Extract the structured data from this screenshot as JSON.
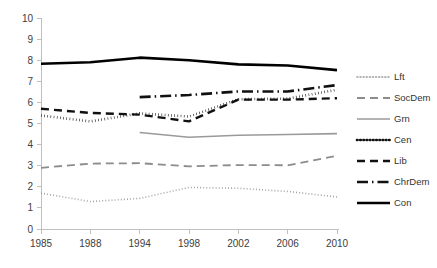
{
  "chart_data": {
    "type": "line",
    "title": "",
    "subtitle": "",
    "xlabel": "",
    "ylabel": "",
    "x": [
      "1985",
      "1988",
      "1994",
      "1998",
      "2002",
      "2006",
      "2010"
    ],
    "categories": [
      "1985",
      "1988",
      "1994",
      "1998",
      "2002",
      "2006",
      "2010"
    ],
    "ylim": [
      0,
      10
    ],
    "yticks": [
      "0",
      "1",
      "2",
      "3",
      "4",
      "5",
      "6",
      "7",
      "8",
      "9",
      "10"
    ],
    "xticks": [
      "1985",
      "1988",
      "1994",
      "1998",
      "2002",
      "2006",
      "2010"
    ],
    "grid": false,
    "legend_position": "right",
    "series": [
      {
        "name": "Lft",
        "style": "fine-dotted",
        "color": "#9a9a9a",
        "width": 1.6,
        "dash": "0.9,2.2",
        "values": [
          1.7,
          1.3,
          1.45,
          1.97,
          1.93,
          1.78,
          1.52
        ]
      },
      {
        "name": "SocDem",
        "style": "dashed",
        "color": "#8c8c8c",
        "width": 1.8,
        "dash": "8,5",
        "values": [
          2.9,
          3.1,
          3.12,
          2.97,
          3.03,
          3.02,
          3.47
        ]
      },
      {
        "name": "Grn",
        "style": "solid",
        "color": "#9a9a9a",
        "width": 1.6,
        "dash": "none",
        "values": [
          null,
          null,
          4.57,
          4.35,
          4.44,
          4.48,
          4.52
        ]
      },
      {
        "name": "Cen",
        "style": "bold-dotted",
        "color": "#111111",
        "width": 2.6,
        "dash": "0.6,2.6",
        "values": [
          5.38,
          5.1,
          5.48,
          5.33,
          6.15,
          6.18,
          6.6
        ]
      },
      {
        "name": "Lib",
        "style": "dashed",
        "color": "#111111",
        "width": 2.4,
        "dash": "8,5",
        "values": [
          5.7,
          5.5,
          5.42,
          5.1,
          6.13,
          6.13,
          6.2
        ]
      },
      {
        "name": "ChrDem",
        "style": "dash-dot",
        "color": "#111111",
        "width": 2.6,
        "dash": "11,4,1.5,4",
        "values": [
          null,
          null,
          6.25,
          6.35,
          6.52,
          6.52,
          6.82
        ]
      },
      {
        "name": "Con",
        "style": "solid",
        "color": "#000000",
        "width": 2.6,
        "dash": "none",
        "values": [
          7.83,
          7.9,
          8.12,
          8.0,
          7.8,
          7.75,
          7.53
        ]
      }
    ]
  },
  "legend": {
    "items": [
      {
        "label": "Lft"
      },
      {
        "label": "SocDem"
      },
      {
        "label": "Grn"
      },
      {
        "label": "Cen"
      },
      {
        "label": "Lib"
      },
      {
        "label": "ChrDem"
      },
      {
        "label": "Con"
      }
    ]
  },
  "colors": {
    "axis": "#bfbfbf",
    "tick_text": "#404040",
    "legend_text": "#333333",
    "background": "#ffffff"
  }
}
